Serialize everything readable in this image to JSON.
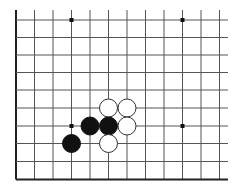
{
  "board": {
    "description": "Go board corner diagram (lower-left corner, board continues up and right)",
    "colors": {
      "background": "#ffffff",
      "line": "#555555",
      "edge": "#222222",
      "black_stone": "#111111",
      "white_stone": "#ffffff"
    },
    "columns_x": [
      16,
      34.5,
      53,
      71.5,
      90,
      108.5,
      127,
      145.5,
      164,
      182.5,
      201,
      219.5
    ],
    "rows_y": [
      20,
      37.5,
      55,
      72.5,
      90,
      108,
      126,
      143.5,
      161.5,
      179.5
    ],
    "line_extent": {
      "top": 10,
      "right": 228
    },
    "edges": [
      "left",
      "bottom"
    ],
    "star_points": [
      {
        "col": 3,
        "row": 0
      },
      {
        "col": 9,
        "row": 0
      },
      {
        "col": 3,
        "row": 6
      },
      {
        "col": 9,
        "row": 6
      }
    ],
    "stones": [
      {
        "color": "white",
        "col": 5,
        "row": 5
      },
      {
        "color": "white",
        "col": 6,
        "row": 5
      },
      {
        "color": "black",
        "col": 4,
        "row": 6
      },
      {
        "color": "black",
        "col": 5,
        "row": 6
      },
      {
        "color": "white",
        "col": 6,
        "row": 6
      },
      {
        "color": "black",
        "col": 3,
        "row": 7
      },
      {
        "color": "white",
        "col": 5,
        "row": 7
      }
    ],
    "stone_radius": 9
  }
}
